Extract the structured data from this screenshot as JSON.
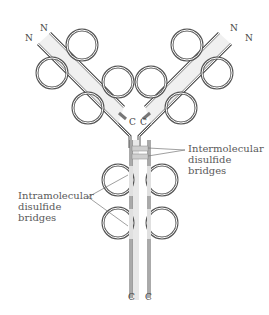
{
  "diagram": {
    "type": "antibody-structure",
    "terminals": {
      "n_left_outer": "N",
      "n_left_inner": "N",
      "n_right_inner": "N",
      "n_right_outer": "N",
      "c_left_hinge": "C",
      "c_right_hinge": "C",
      "c_left_bottom": "C",
      "c_right_bottom": "C"
    },
    "labels": {
      "intermolecular": [
        "Intermolecular",
        "disulfide",
        "bridges"
      ],
      "intramolecular": [
        "Intramolecular",
        "disulfide",
        "bridges"
      ]
    },
    "bond_glyph": "S–S",
    "sulfur_glyph": "S",
    "colors": {
      "chain_stroke": "#666666",
      "chain_inner": "#ffffff",
      "bridge_fill": "#cfcfcf",
      "text": "#555555"
    }
  }
}
